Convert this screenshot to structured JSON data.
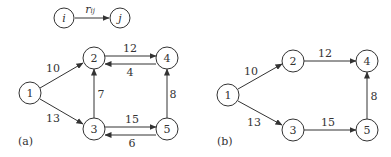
{
  "legend": {
    "from": "i",
    "to": "j",
    "edge_label": "r",
    "edge_label_sub": "ij"
  },
  "panel_a": {
    "label": "(a)",
    "nodes": [
      "1",
      "2",
      "3",
      "4",
      "5"
    ],
    "edges": [
      {
        "from": "1",
        "to": "2",
        "weight": "10"
      },
      {
        "from": "1",
        "to": "3",
        "weight": "13"
      },
      {
        "from": "2",
        "to": "4",
        "weight": "12"
      },
      {
        "from": "4",
        "to": "2",
        "weight": "4"
      },
      {
        "from": "3",
        "to": "2",
        "weight": "7"
      },
      {
        "from": "3",
        "to": "5",
        "weight": "15"
      },
      {
        "from": "5",
        "to": "3",
        "weight": "6"
      },
      {
        "from": "5",
        "to": "4",
        "weight": "8"
      }
    ]
  },
  "panel_b": {
    "label": "(b)",
    "nodes": [
      "1",
      "2",
      "3",
      "4",
      "5"
    ],
    "edges": [
      {
        "from": "1",
        "to": "2",
        "weight": "10"
      },
      {
        "from": "1",
        "to": "3",
        "weight": "13"
      },
      {
        "from": "2",
        "to": "4",
        "weight": "12"
      },
      {
        "from": "3",
        "to": "5",
        "weight": "15"
      },
      {
        "from": "5",
        "to": "4",
        "weight": "8"
      }
    ]
  }
}
